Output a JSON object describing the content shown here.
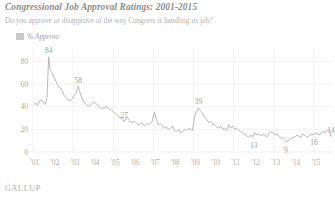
{
  "header": {
    "title": "Congressional Job Approval Ratings: 2001-2015",
    "subtitle": "Do you approve or disapprove of the way Congress is handling its job?"
  },
  "legend": {
    "label": "% Approve",
    "swatch_color": "#c9c9c9"
  },
  "branding": {
    "logo_text": "GALLUP",
    "footer_note": ""
  },
  "colors": {
    "line": "#b9b9b9",
    "grid": "#ededed",
    "text": "#a0a0a0",
    "background": "#ffffff"
  },
  "chart_data": {
    "type": "line",
    "title": "Congressional Job Approval Ratings: 2001-2015",
    "subtitle": "Do you approve or disapprove of the way Congress is handling its job?",
    "xlabel": "",
    "ylabel": "",
    "ylim": [
      0,
      90
    ],
    "yticks": [
      0,
      20,
      40,
      60,
      80
    ],
    "ytick_labels": [
      "0",
      "20",
      "40",
      "60",
      "80"
    ],
    "xlim": [
      2001,
      2015.9
    ],
    "xticks": [
      2001,
      2002,
      2003,
      2004,
      2005,
      2006,
      2007,
      2008,
      2009,
      2010,
      2011,
      2012,
      2013,
      2014,
      2015
    ],
    "xtick_labels": [
      "'01",
      "'02",
      "'03",
      "'04",
      "'05",
      "'06",
      "'07",
      "'08",
      "'09",
      "'10",
      "'11",
      "'12",
      "'13",
      "'14",
      "'15"
    ],
    "grid": true,
    "legend_position": "top-left",
    "series": [
      {
        "name": "% Approve",
        "color": "#b9b9b9",
        "x": [
          2001.05,
          2001.14,
          2001.22,
          2001.3,
          2001.38,
          2001.46,
          2001.54,
          2001.62,
          2001.7,
          2001.78,
          2001.86,
          2001.94,
          2002.05,
          2002.15,
          2002.25,
          2002.35,
          2002.45,
          2002.55,
          2002.65,
          2002.75,
          2002.85,
          2002.95,
          2003.05,
          2003.15,
          2003.25,
          2003.35,
          2003.45,
          2003.55,
          2003.65,
          2003.75,
          2003.85,
          2003.95,
          2004.05,
          2004.18,
          2004.3,
          2004.42,
          2004.55,
          2004.68,
          2004.8,
          2004.92,
          2005.05,
          2005.18,
          2005.3,
          2005.42,
          2005.55,
          2005.68,
          2005.8,
          2005.92,
          2006.05,
          2006.18,
          2006.3,
          2006.42,
          2006.55,
          2006.68,
          2006.8,
          2006.92,
          2007.05,
          2007.15,
          2007.25,
          2007.35,
          2007.45,
          2007.55,
          2007.65,
          2007.75,
          2007.85,
          2007.95,
          2008.05,
          2008.15,
          2008.25,
          2008.35,
          2008.45,
          2008.55,
          2008.65,
          2008.75,
          2008.85,
          2008.95,
          2009.05,
          2009.15,
          2009.25,
          2009.35,
          2009.45,
          2009.55,
          2009.65,
          2009.75,
          2009.85,
          2009.95,
          2010.05,
          2010.15,
          2010.25,
          2010.35,
          2010.45,
          2010.55,
          2010.65,
          2010.75,
          2010.85,
          2010.95,
          2011.05,
          2011.15,
          2011.25,
          2011.35,
          2011.45,
          2011.55,
          2011.65,
          2011.75,
          2011.85,
          2011.95,
          2012.05,
          2012.15,
          2012.25,
          2012.35,
          2012.45,
          2012.55,
          2012.65,
          2012.75,
          2012.85,
          2012.95,
          2013.05,
          2013.15,
          2013.25,
          2013.35,
          2013.45,
          2013.55,
          2013.65,
          2013.75,
          2013.85,
          2013.95,
          2014.05,
          2014.15,
          2014.25,
          2014.35,
          2014.45,
          2014.55,
          2014.65,
          2014.75,
          2014.85,
          2014.95,
          2015.05,
          2015.15,
          2015.25,
          2015.35,
          2015.45,
          2015.55,
          2015.65,
          2015.75,
          2015.85
        ],
        "y": [
          42,
          43,
          41,
          44,
          46,
          45,
          43,
          42,
          48,
          84,
          72,
          70,
          66,
          62,
          58,
          57,
          54,
          50,
          48,
          46,
          45,
          47,
          50,
          52,
          58,
          52,
          47,
          44,
          42,
          40,
          41,
          43,
          44,
          42,
          40,
          38,
          39,
          40,
          38,
          37,
          35,
          33,
          31,
          29,
          27,
          31,
          28,
          26,
          27,
          25,
          24,
          26,
          23,
          25,
          24,
          26,
          35,
          29,
          24,
          25,
          23,
          21,
          22,
          20,
          21,
          23,
          19,
          18,
          20,
          17,
          18,
          20,
          19,
          21,
          20,
          19,
          31,
          36,
          39,
          36,
          34,
          31,
          29,
          26,
          27,
          25,
          24,
          22,
          21,
          23,
          20,
          21,
          19,
          24,
          21,
          23,
          20,
          21,
          19,
          18,
          17,
          16,
          14,
          13,
          15,
          13,
          17,
          15,
          16,
          14,
          16,
          15,
          13,
          16,
          18,
          17,
          15,
          16,
          14,
          12,
          13,
          11,
          9,
          10,
          12,
          13,
          13,
          15,
          14,
          13,
          16,
          15,
          13,
          14,
          16,
          15,
          16,
          17,
          15,
          16,
          18,
          17,
          19,
          20,
          14
        ],
        "point_labels": [
          {
            "x": 2001.78,
            "y": 84,
            "text": "84"
          },
          {
            "x": 2003.25,
            "y": 58,
            "text": "58"
          },
          {
            "x": 2005.55,
            "y": 27,
            "text": "27"
          },
          {
            "x": 2009.25,
            "y": 39,
            "text": "39"
          },
          {
            "x": 2012.0,
            "y": 13,
            "text": "13"
          },
          {
            "x": 2013.6,
            "y": 9,
            "text": "9"
          },
          {
            "x": 2015.0,
            "y": 16,
            "text": "16"
          },
          {
            "x": 2015.85,
            "y": 14,
            "text": "14"
          }
        ]
      }
    ]
  }
}
